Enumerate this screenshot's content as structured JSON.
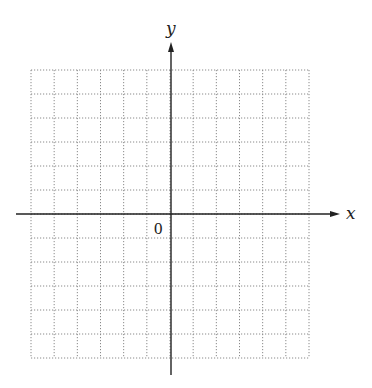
{
  "diagram": {
    "type": "coordinate-plane",
    "x_axis_label": "x",
    "y_axis_label": "y",
    "origin_label": "0",
    "grid": {
      "columns": 12,
      "rows": 12,
      "left": 31,
      "right": 309,
      "top": 70,
      "bottom": 358,
      "line_style": "dotted",
      "line_color": "#8a8a8a"
    },
    "axes": {
      "origin_x": 171,
      "origin_y": 214,
      "x_start": 16,
      "x_end": 340,
      "y_start": 375,
      "y_end": 42,
      "color": "#222222"
    }
  }
}
